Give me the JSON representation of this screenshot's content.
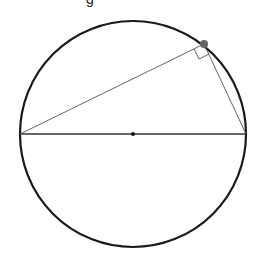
{
  "caption": {
    "fragment": "g"
  },
  "diagram": {
    "type": "geometry",
    "circle": {
      "cx": 133,
      "cy": 134,
      "r": 113,
      "stroke": "#1a1a1a"
    },
    "center_point": {
      "x": 133,
      "y": 134
    },
    "diameter": {
      "x1": 20,
      "y1": 134,
      "x2": 246,
      "y2": 134
    },
    "vertex_on_circle": {
      "x": 204,
      "y": 44,
      "color": "#666666"
    },
    "right_angle_marker": true
  }
}
